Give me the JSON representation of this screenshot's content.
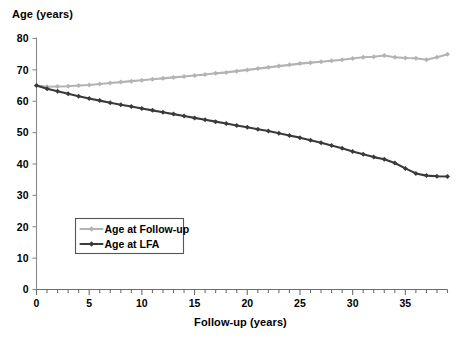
{
  "chart_data": {
    "type": "line",
    "title": "",
    "ylabel": "Age (years)",
    "xlabel": "Follow-up (years)",
    "xlim": [
      0,
      39
    ],
    "ylim": [
      0,
      80
    ],
    "xticks_major": [
      0,
      5,
      10,
      15,
      20,
      25,
      30,
      35
    ],
    "xtick_labels": [
      "0",
      "5",
      "10",
      "15",
      "20",
      "25",
      "30",
      "35"
    ],
    "xtick_minor_step": 1,
    "yticks": [
      0,
      10,
      20,
      30,
      40,
      50,
      60,
      70,
      80
    ],
    "ytick_labels": [
      "0",
      "10",
      "20",
      "30",
      "40",
      "50",
      "60",
      "70",
      "80"
    ],
    "grid": false,
    "legend_position": "lower-left-inside",
    "x": [
      0,
      1,
      2,
      3,
      4,
      5,
      6,
      7,
      8,
      9,
      10,
      11,
      12,
      13,
      14,
      15,
      16,
      17,
      18,
      19,
      20,
      21,
      22,
      23,
      24,
      25,
      26,
      27,
      28,
      29,
      30,
      31,
      32,
      33,
      34,
      35,
      36,
      37,
      38,
      39
    ],
    "series": [
      {
        "name": "Age at Follow-up",
        "color": "#b3b3b3",
        "marker": "diamond",
        "values": [
          65.0,
          64.6,
          64.7,
          64.8,
          65.0,
          65.2,
          65.5,
          65.8,
          66.1,
          66.4,
          66.7,
          67.0,
          67.3,
          67.6,
          67.9,
          68.2,
          68.5,
          68.9,
          69.2,
          69.6,
          70.0,
          70.4,
          70.8,
          71.2,
          71.6,
          72.0,
          72.3,
          72.6,
          72.9,
          73.2,
          73.6,
          74.0,
          74.2,
          74.6,
          74.0,
          73.8,
          73.7,
          73.2,
          74.0,
          75.0
        ]
      },
      {
        "name": "Age at LFA",
        "color": "#3a3a3a",
        "marker": "diamond",
        "values": [
          65.0,
          64.0,
          63.2,
          62.4,
          61.6,
          60.9,
          60.2,
          59.5,
          58.9,
          58.3,
          57.7,
          57.1,
          56.5,
          55.9,
          55.3,
          54.7,
          54.1,
          53.5,
          52.9,
          52.3,
          51.7,
          51.1,
          50.5,
          49.8,
          49.1,
          48.4,
          47.6,
          46.8,
          45.9,
          45.0,
          44.0,
          43.1,
          42.2,
          41.5,
          40.3,
          38.6,
          37.0,
          36.3,
          36.1,
          36.0
        ]
      }
    ]
  },
  "legend": {
    "items": [
      {
        "label": "Age at Follow-up",
        "color": "#b3b3b3"
      },
      {
        "label": "Age at LFA",
        "color": "#3a3a3a"
      }
    ]
  }
}
